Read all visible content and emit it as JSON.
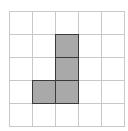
{
  "diagram": {
    "type": "grid-shape",
    "columns": 5,
    "rows": 5,
    "cell_size_px": 23,
    "grid_color": "#c8c8c8",
    "fill_color": "#a9a9a9",
    "outline_color": "#3a3a3a",
    "filled_cells": [
      {
        "row": 1,
        "col": 2
      },
      {
        "row": 2,
        "col": 2
      },
      {
        "row": 3,
        "col": 1
      },
      {
        "row": 3,
        "col": 2
      }
    ]
  }
}
